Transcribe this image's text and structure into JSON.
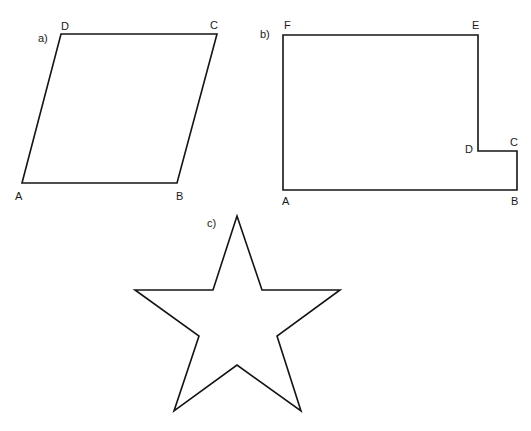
{
  "figures": {
    "a": {
      "label": "a)",
      "vertices": [
        {
          "name": "A",
          "x": 22,
          "y": 183
        },
        {
          "name": "B",
          "x": 177,
          "y": 183
        },
        {
          "name": "C",
          "x": 217,
          "y": 34
        },
        {
          "name": "D",
          "x": 61,
          "y": 34
        }
      ],
      "labels": {
        "A": "A",
        "B": "B",
        "C": "C",
        "D": "D"
      }
    },
    "b": {
      "label": "b)",
      "vertices": [
        {
          "name": "A",
          "x": 283,
          "y": 190
        },
        {
          "name": "B",
          "x": 517,
          "y": 190
        },
        {
          "name": "C",
          "x": 517,
          "y": 151
        },
        {
          "name": "D",
          "x": 478,
          "y": 151
        },
        {
          "name": "E",
          "x": 478,
          "y": 35
        },
        {
          "name": "F",
          "x": 283,
          "y": 35
        }
      ],
      "labels": {
        "A": "A",
        "B": "B",
        "C": "C",
        "D": "D",
        "E": "E",
        "F": "F"
      }
    },
    "c": {
      "label": "c)",
      "shape": "five-pointed star"
    }
  }
}
